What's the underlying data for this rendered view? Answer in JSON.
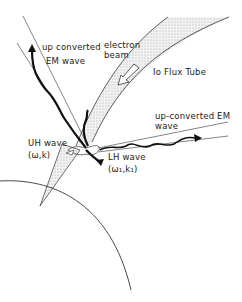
{
  "diagram": {
    "labels": {
      "up_converted_left_line1": "up converted",
      "up_converted_left_line2": "EM wave",
      "electron_beam_line1": "electron",
      "electron_beam_line2": "beam",
      "io_flux_tube": "Io Flux Tube",
      "up_converted_right_line1": "up-converted  EM",
      "up_converted_right_line2": "wave",
      "uh_wave_line1": "UH wave",
      "uh_wave_line2": "(ω,k)",
      "lh_wave_line1": "LH wave",
      "lh_wave_line2": "(ω₁,k₁)"
    },
    "colors": {
      "line": "#333333",
      "wave": "#111111",
      "tube_fill": "#e6e6e6"
    }
  }
}
